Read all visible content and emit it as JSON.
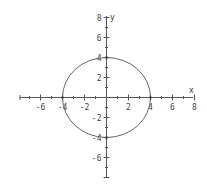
{
  "chart_data": {
    "type": "line",
    "title": "",
    "xlabel": "x",
    "ylabel": "y",
    "xlim": [
      -8,
      8
    ],
    "ylim": [
      -8,
      8
    ],
    "grid": false,
    "legend": null,
    "x_ticks": [
      -6,
      -4,
      -2,
      2,
      4,
      6,
      8
    ],
    "y_ticks": [
      8,
      6,
      4,
      2,
      -2,
      -4,
      -6
    ],
    "x_tick_labels": [
      "-6",
      "-4",
      "-2",
      "2",
      "4",
      "6",
      "8"
    ],
    "y_tick_labels": [
      "8",
      "6",
      "4",
      "2",
      "-2",
      "-4",
      "-6"
    ],
    "series": [
      {
        "name": "circle",
        "equation": "x^2 + y^2 = 16",
        "center": [
          0,
          0
        ],
        "radius": 4,
        "intercepts": [
          [
            -4,
            0
          ],
          [
            4,
            0
          ],
          [
            0,
            4
          ],
          [
            0,
            -4
          ]
        ]
      }
    ],
    "colors": {
      "axis": "#555555",
      "curve": "#666666",
      "text": "#444444"
    }
  }
}
